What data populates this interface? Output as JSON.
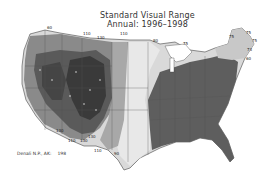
{
  "title": {
    "line1": "Standard Visual Range",
    "line2": "Annual: 1996–1998"
  },
  "map": {
    "region": "Contiguous United States",
    "shading": "grayscale contours; darker = higher visual range",
    "colors": {
      "darkest": "#3a3a3a",
      "dark": "#5a5a5a",
      "mid": "#8a8a8a",
      "light": "#b5b5b5",
      "lightest": "#dcdcdc",
      "east": "#5e5e5e"
    },
    "contour_labels": [
      {
        "text": "110",
        "x": 83,
        "y": 35
      },
      {
        "text": "130",
        "x": 97,
        "y": 39
      },
      {
        "text": "110",
        "x": 120,
        "y": 35
      },
      {
        "text": "60",
        "x": 47,
        "y": 29
      },
      {
        "text": "80",
        "x": 153,
        "y": 42
      },
      {
        "text": "75",
        "x": 183,
        "y": 45
      },
      {
        "text": "75",
        "x": 229,
        "y": 38
      },
      {
        "text": "75",
        "x": 246,
        "y": 34
      },
      {
        "text": "75",
        "x": 252,
        "y": 42
      },
      {
        "text": "73",
        "x": 247,
        "y": 51
      },
      {
        "text": "60",
        "x": 246,
        "y": 60
      },
      {
        "text": "130",
        "x": 56,
        "y": 132
      },
      {
        "text": "110",
        "x": 68,
        "y": 142
      },
      {
        "text": "130",
        "x": 80,
        "y": 142
      },
      {
        "text": "130",
        "x": 88,
        "y": 138
      },
      {
        "text": "110",
        "x": 94,
        "y": 152
      },
      {
        "text": "90",
        "x": 114,
        "y": 155
      }
    ]
  },
  "inset": {
    "label": "Denali N.P., AK:",
    "value": "198"
  }
}
